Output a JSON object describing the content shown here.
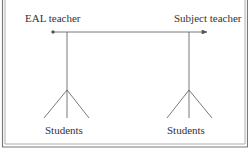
{
  "diagram": {
    "nodes": {
      "eal_teacher": {
        "label": "EAL teacher"
      },
      "subject_teacher": {
        "label": "Subject teacher"
      },
      "students_left": {
        "label": "Students"
      },
      "students_right": {
        "label": "Students"
      }
    },
    "edges": [
      {
        "from": "eal_teacher",
        "to": "subject_teacher",
        "type": "bidirectional-line-with-arrow-right"
      },
      {
        "from": "eal_teacher",
        "to": "students_left",
        "type": "tree-branch"
      },
      {
        "from": "subject_teacher",
        "to": "students_right",
        "type": "tree-branch"
      }
    ],
    "colors": {
      "line": "#555555",
      "frame": "#777777",
      "text": "#333333",
      "background": "#ffffff"
    }
  }
}
